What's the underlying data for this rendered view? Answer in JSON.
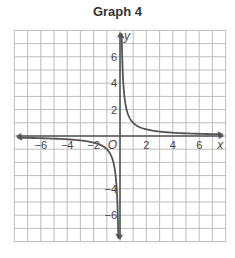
{
  "title": "Graph 4",
  "chart_data": {
    "type": "line",
    "title": "Graph 4",
    "xlabel": "x",
    "ylabel": "y",
    "origin_label": "O",
    "xlim": [
      -8,
      8
    ],
    "ylim": [
      -8,
      8
    ],
    "grid": true,
    "x_ticks": [
      -6,
      -4,
      -2,
      2,
      4,
      6
    ],
    "y_ticks": [
      6,
      4,
      2,
      -4,
      -6
    ],
    "x_tick_labels": [
      "−6",
      "−4",
      "−2",
      "2",
      "4",
      "6"
    ],
    "y_tick_labels": [
      "6",
      "4",
      "2",
      "−4",
      "−6"
    ],
    "series": [
      {
        "name": "y = 1/x (x > 0)",
        "x": [
          0.13,
          0.2,
          0.25,
          0.5,
          1,
          2,
          4,
          6,
          8
        ],
        "y": [
          7.7,
          5,
          4,
          2,
          1,
          0.5,
          0.25,
          0.17,
          0.125
        ]
      },
      {
        "name": "y = 1/x (x < 0)",
        "x": [
          -8,
          -6,
          -4,
          -2,
          -1,
          -0.5,
          -0.25,
          -0.2,
          -0.13
        ],
        "y": [
          -0.125,
          -0.17,
          -0.25,
          -0.5,
          -1,
          -2,
          -4,
          -5,
          -7.7
        ]
      }
    ],
    "colors": {
      "curve": "#555555",
      "axis": "#555555",
      "grid": "#bdbdbd"
    }
  }
}
